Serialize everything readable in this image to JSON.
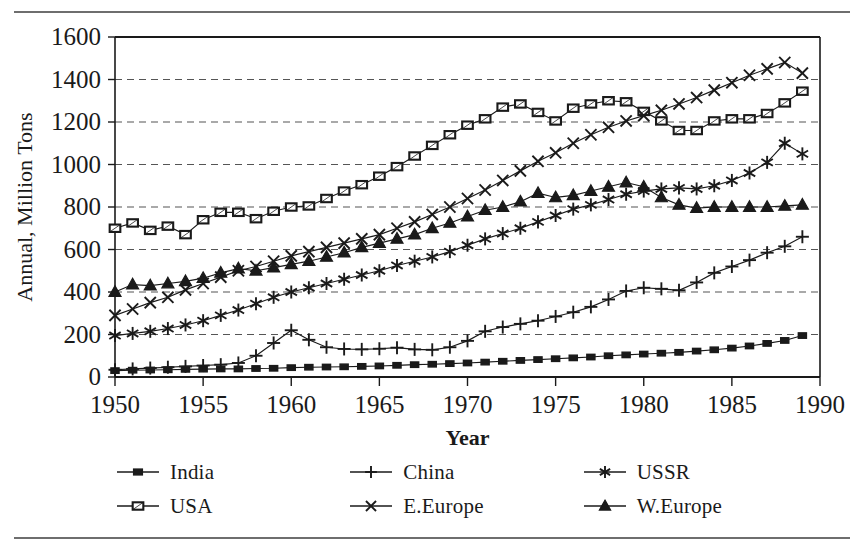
{
  "chart_data": {
    "type": "line",
    "title": "",
    "xlabel": "Year",
    "ylabel": "Annual, Million Tons",
    "xlim": [
      1950,
      1990
    ],
    "ylim": [
      0,
      1600
    ],
    "xticks": [
      1950,
      1955,
      1960,
      1965,
      1970,
      1975,
      1980,
      1985,
      1990
    ],
    "yticks": [
      0,
      200,
      400,
      600,
      800,
      1000,
      1200,
      1400,
      1600
    ],
    "grid": "horizontal-dashed",
    "legend_position": "bottom",
    "x": [
      1950,
      1951,
      1952,
      1953,
      1954,
      1955,
      1956,
      1957,
      1958,
      1959,
      1960,
      1961,
      1962,
      1963,
      1964,
      1965,
      1966,
      1967,
      1968,
      1969,
      1970,
      1971,
      1972,
      1973,
      1974,
      1975,
      1976,
      1977,
      1978,
      1979,
      1980,
      1981,
      1982,
      1983,
      1984,
      1985,
      1986,
      1987,
      1988,
      1989
    ],
    "series": [
      {
        "name": "India",
        "marker": "filled-square",
        "values": [
          30,
          32,
          33,
          34,
          36,
          37,
          38,
          38,
          40,
          41,
          44,
          46,
          47,
          48,
          50,
          52,
          55,
          58,
          60,
          63,
          66,
          70,
          74,
          78,
          82,
          86,
          90,
          94,
          100,
          104,
          108,
          112,
          116,
          122,
          128,
          136,
          146,
          158,
          172,
          195
        ]
      },
      {
        "name": "China",
        "marker": "plus",
        "values": [
          34,
          38,
          42,
          46,
          50,
          54,
          58,
          66,
          100,
          160,
          220,
          175,
          140,
          132,
          130,
          133,
          138,
          130,
          128,
          140,
          170,
          215,
          235,
          250,
          265,
          285,
          305,
          330,
          365,
          405,
          420,
          415,
          408,
          445,
          490,
          520,
          550,
          585,
          615,
          660
        ]
      },
      {
        "name": "USSR",
        "marker": "asterisk",
        "values": [
          195,
          205,
          215,
          228,
          245,
          265,
          290,
          315,
          345,
          375,
          400,
          420,
          440,
          460,
          480,
          500,
          525,
          545,
          565,
          590,
          620,
          650,
          675,
          700,
          730,
          760,
          790,
          810,
          835,
          860,
          875,
          885,
          890,
          885,
          900,
          925,
          960,
          1010,
          1100,
          1050
        ]
      },
      {
        "name": "USA",
        "marker": "open-square",
        "values": [
          700,
          725,
          690,
          710,
          670,
          740,
          775,
          775,
          745,
          780,
          800,
          805,
          840,
          875,
          905,
          945,
          990,
          1040,
          1090,
          1140,
          1185,
          1215,
          1270,
          1285,
          1245,
          1205,
          1265,
          1285,
          1300,
          1295,
          1250,
          1205,
          1160,
          1160,
          1205,
          1215,
          1215,
          1240,
          1290,
          1345
        ]
      },
      {
        "name": "E.Europe",
        "marker": "x",
        "values": [
          290,
          320,
          350,
          375,
          410,
          440,
          470,
          500,
          520,
          545,
          570,
          590,
          610,
          630,
          650,
          670,
          700,
          730,
          765,
          800,
          840,
          880,
          925,
          970,
          1015,
          1055,
          1100,
          1140,
          1175,
          1205,
          1230,
          1255,
          1285,
          1315,
          1350,
          1385,
          1420,
          1450,
          1480,
          1430
        ]
      },
      {
        "name": "W.Europe",
        "marker": "filled-triangle",
        "values": [
          400,
          435,
          430,
          440,
          450,
          465,
          490,
          510,
          500,
          515,
          530,
          545,
          565,
          585,
          610,
          630,
          650,
          670,
          700,
          725,
          755,
          785,
          800,
          825,
          865,
          845,
          855,
          875,
          895,
          915,
          895,
          845,
          810,
          795,
          800,
          800,
          800,
          800,
          805,
          810
        ]
      }
    ]
  },
  "legend": {
    "items": [
      {
        "label": "India",
        "marker": "filled-square",
        "icon": "legend-marker-filled-square-icon"
      },
      {
        "label": "China",
        "marker": "plus",
        "icon": "legend-marker-plus-icon"
      },
      {
        "label": "USSR",
        "marker": "asterisk",
        "icon": "legend-marker-asterisk-icon"
      },
      {
        "label": "USA",
        "marker": "open-square",
        "icon": "legend-marker-open-square-icon"
      },
      {
        "label": "E.Europe",
        "marker": "x",
        "icon": "legend-marker-x-icon"
      },
      {
        "label": "W.Europe",
        "marker": "filled-triangle",
        "icon": "legend-marker-filled-triangle-icon"
      }
    ]
  },
  "colors": {
    "ink": "#1a1a1a",
    "grid": "#555555",
    "rule": "#6e6e6e",
    "background": "#ffffff"
  }
}
